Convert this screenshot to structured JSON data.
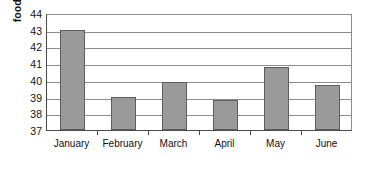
{
  "chart_data": {
    "type": "bar",
    "title": "",
    "subtitle": "",
    "xlabel": "",
    "ylabel": "food cost %",
    "categories": [
      "January",
      "February",
      "March",
      "April",
      "May",
      "June"
    ],
    "values": [
      43.0,
      38.95,
      39.9,
      38.8,
      40.8,
      39.7
    ],
    "series": [
      {
        "name": "food cost %",
        "values": [
          43.0,
          38.95,
          39.9,
          38.8,
          40.8,
          39.7
        ]
      }
    ],
    "ylim": [
      37,
      44
    ],
    "ytick_labels": [
      "37",
      "38",
      "39",
      "40",
      "41",
      "42",
      "43",
      "44"
    ],
    "ytick_values": [
      37,
      38,
      39,
      40,
      41,
      42,
      43,
      44
    ],
    "grid": true,
    "grid_axis": "y",
    "legend": false,
    "legend_position": "none",
    "bar_color": "#9a9a9a",
    "bar_edge_color": "#5d5d5d",
    "background_color": "#ffffff",
    "axis_color": "#4a4a4a",
    "gridline_color": "#8d8d8d"
  }
}
